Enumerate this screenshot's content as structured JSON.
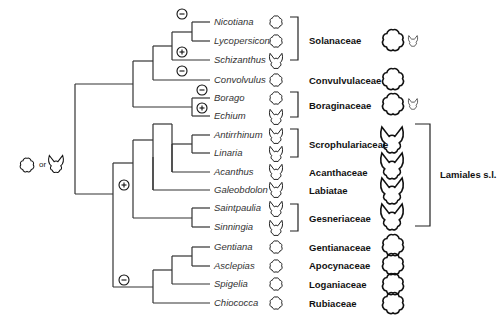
{
  "root_state": {
    "icons": [
      "actinomorphic-corolla-icon",
      "zygomorphic-corolla-icon"
    ],
    "connector": "or"
  },
  "symbols": {
    "plus": "+",
    "minus": "−"
  },
  "taxa": [
    {
      "name": "Nicotiana",
      "corolla": "actinomorphic"
    },
    {
      "name": "Lycopersicon",
      "corolla": "actinomorphic"
    },
    {
      "name": "Schizanthus",
      "corolla": "zygomorphic"
    },
    {
      "name": "Convolvulus",
      "corolla": "actinomorphic"
    },
    {
      "name": "Borago",
      "corolla": "actinomorphic"
    },
    {
      "name": "Echium",
      "corolla": "zygomorphic"
    },
    {
      "name": "Antirrhinum",
      "corolla": "zygomorphic"
    },
    {
      "name": "Linaria",
      "corolla": "zygomorphic"
    },
    {
      "name": "Acanthus",
      "corolla": "zygomorphic"
    },
    {
      "name": "Galeobdolon",
      "corolla": "zygomorphic"
    },
    {
      "name": "Saintpaulia",
      "corolla": "zygomorphic"
    },
    {
      "name": "Sinningia",
      "corolla": "zygomorphic"
    },
    {
      "name": "Gentiana",
      "corolla": "actinomorphic"
    },
    {
      "name": "Asclepias",
      "corolla": "actinomorphic"
    },
    {
      "name": "Spigelia",
      "corolla": "actinomorphic"
    },
    {
      "name": "Chiococca",
      "corolla": "actinomorphic"
    }
  ],
  "families": [
    {
      "name": "Solanaceae",
      "large_icons": [
        "actinomorphic",
        "zygomorphic-small"
      ]
    },
    {
      "name": "Convulvulaceae",
      "large_icons": [
        "actinomorphic"
      ]
    },
    {
      "name": "Boraginaceae",
      "large_icons": [
        "actinomorphic",
        "zygomorphic-small"
      ]
    },
    {
      "name": "Scrophulariaceae",
      "large_icons": [
        "zygomorphic"
      ]
    },
    {
      "name": "Acanthaceae",
      "large_icons": [
        "zygomorphic"
      ]
    },
    {
      "name": "Labiatae",
      "large_icons": [
        "zygomorphic"
      ]
    },
    {
      "name": "Gesneriaceae",
      "large_icons": [
        "zygomorphic"
      ]
    },
    {
      "name": "Gentianaceae",
      "large_icons": [
        "actinomorphic"
      ]
    },
    {
      "name": "Apocynaceae",
      "large_icons": [
        "actinomorphic"
      ]
    },
    {
      "name": "Loganiaceae",
      "large_icons": [
        "actinomorphic"
      ]
    },
    {
      "name": "Rubiaceae",
      "large_icons": [
        "actinomorphic"
      ]
    }
  ],
  "order_group": {
    "label": "Lamiales s.l."
  }
}
